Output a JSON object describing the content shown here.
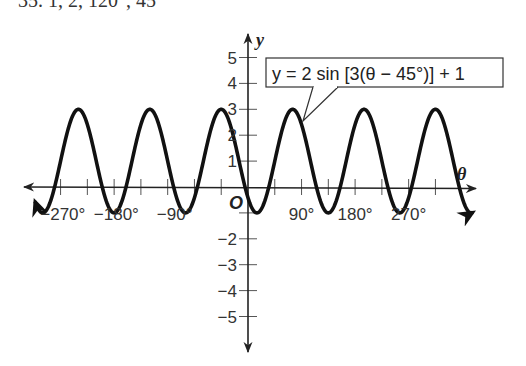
{
  "header": {
    "text": "35. 1, 2, 120°, 45°"
  },
  "chart_data": {
    "type": "line",
    "title": "",
    "equation": "y = 2 sin [3(θ − 45°)] + 1",
    "amplitude": 2,
    "period_deg": 120,
    "phase_shift_deg": 45,
    "vertical_shift": 1,
    "xlabel": "θ",
    "ylabel": "y",
    "origin_label": "O",
    "xlim": [
      -360,
      375
    ],
    "ylim": [
      -5.5,
      5.8
    ],
    "x_ticks_deg": [
      -315,
      -270,
      -225,
      -180,
      -135,
      -90,
      -45,
      0,
      45,
      90,
      135,
      180,
      225,
      270,
      315
    ],
    "x_tick_labels": [
      {
        "value": -270,
        "label": "−270°"
      },
      {
        "value": -180,
        "label": "−180°"
      },
      {
        "value": -90,
        "label": "−90°"
      },
      {
        "value": 90,
        "label": "90°"
      },
      {
        "value": 180,
        "label": "180°"
      },
      {
        "value": 270,
        "label": "270°"
      }
    ],
    "y_tick_labels": [
      {
        "value": 5,
        "label": "5"
      },
      {
        "value": 4,
        "label": "4"
      },
      {
        "value": 3,
        "label": "3"
      },
      {
        "value": 2,
        "label": "2"
      },
      {
        "value": 1,
        "label": "1"
      },
      {
        "value": -2,
        "label": "−2"
      },
      {
        "value": -3,
        "label": "−3"
      },
      {
        "value": -4,
        "label": "−4"
      },
      {
        "value": -5,
        "label": "−5"
      }
    ],
    "maxima": [
      [
        -285,
        3
      ],
      [
        -165,
        3
      ],
      [
        -45,
        3
      ],
      [
        75,
        3
      ],
      [
        195,
        3
      ],
      [
        315,
        3
      ]
    ],
    "minima": [
      [
        -345,
        -1
      ],
      [
        -225,
        -1
      ],
      [
        -105,
        -1
      ],
      [
        15,
        -1
      ],
      [
        135,
        -1
      ],
      [
        255,
        -1
      ]
    ],
    "grid": false,
    "legend": null
  },
  "style": {
    "curve_color": "#111111",
    "axis_color": "#222222",
    "text_color": "#333333"
  }
}
